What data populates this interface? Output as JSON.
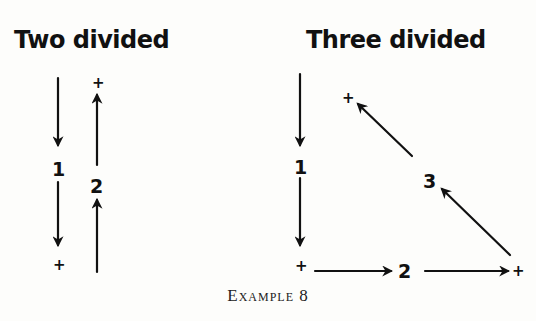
{
  "figures": [
    {
      "id": "two",
      "title": "Two divided",
      "labels": {
        "n1": "1",
        "n2": "2",
        "plus": "+"
      }
    },
    {
      "id": "three",
      "title": "Three divided",
      "labels": {
        "n1": "1",
        "n2": "2",
        "n3": "3",
        "plus": "+"
      }
    }
  ],
  "caption": "Example 8",
  "colors": {
    "ink": "#111111",
    "paper": "#fdfdfb"
  }
}
